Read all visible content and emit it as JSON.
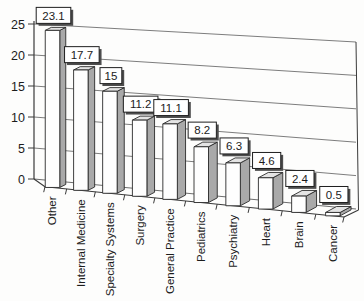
{
  "chart_data": {
    "type": "bar",
    "style": "3d-perspective",
    "title": "",
    "xlabel": "",
    "ylabel": "",
    "categories": [
      "Other",
      "Internal Medicine",
      "Specialty Systems",
      "Surgery",
      "General Practice",
      "Pediatrics",
      "Psychiatry",
      "Heart",
      "Brain",
      "Cancer"
    ],
    "values": [
      23.1,
      17.7,
      15,
      11.2,
      11.1,
      8.2,
      6.3,
      4.6,
      2.4,
      0.5
    ],
    "data_labels": [
      "23.1",
      "17.7",
      "15",
      "11.2",
      "11.1",
      "8.2",
      "6.3",
      "4.6",
      "2.4",
      "0.5"
    ],
    "ylim": [
      0,
      25
    ],
    "yticks": [
      0,
      5,
      10,
      15,
      20,
      25
    ],
    "grid": true,
    "legend": false,
    "colors": {
      "background": "#fdfdfc",
      "bar_front": "#fefefe",
      "bar_side": "#a9a9a9",
      "bar_top": "#e4e4e4",
      "bar_outline": "#2a2a2a",
      "gridline": "#6e6e6e",
      "axis": "#3a3a3a",
      "label_box_bg": "#ffffff",
      "label_box_border": "#1f1f1f",
      "label_box_shadow": "#4d4d4d",
      "text": "#1c1c1c"
    }
  }
}
